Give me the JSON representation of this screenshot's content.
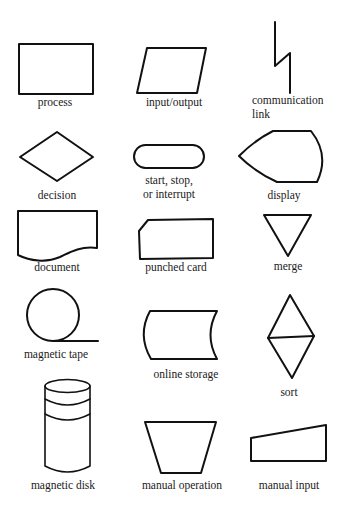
{
  "diagram": {
    "colors": {
      "stroke": "#111111",
      "text": "#1a1a1a",
      "background": "#ffffff"
    },
    "symbols": [
      {
        "id": "process",
        "lines": [
          "process"
        ]
      },
      {
        "id": "input-output",
        "lines": [
          "input/output"
        ]
      },
      {
        "id": "communication-link",
        "lines": [
          "communication",
          "link"
        ]
      },
      {
        "id": "decision",
        "lines": [
          "decision"
        ]
      },
      {
        "id": "terminal",
        "lines": [
          "start, stop,",
          "or interrupt"
        ]
      },
      {
        "id": "display",
        "lines": [
          "display"
        ]
      },
      {
        "id": "document",
        "lines": [
          "document"
        ]
      },
      {
        "id": "punched-card",
        "lines": [
          "punched card"
        ]
      },
      {
        "id": "merge",
        "lines": [
          "merge"
        ]
      },
      {
        "id": "magnetic-tape",
        "lines": [
          "magnetic tape"
        ]
      },
      {
        "id": "online-storage",
        "lines": [
          "online storage"
        ]
      },
      {
        "id": "sort",
        "lines": [
          "sort"
        ]
      },
      {
        "id": "magnetic-disk",
        "lines": [
          "magnetic disk"
        ]
      },
      {
        "id": "manual-operation",
        "lines": [
          "manual operation"
        ]
      },
      {
        "id": "manual-input",
        "lines": [
          "manual input"
        ]
      }
    ]
  }
}
